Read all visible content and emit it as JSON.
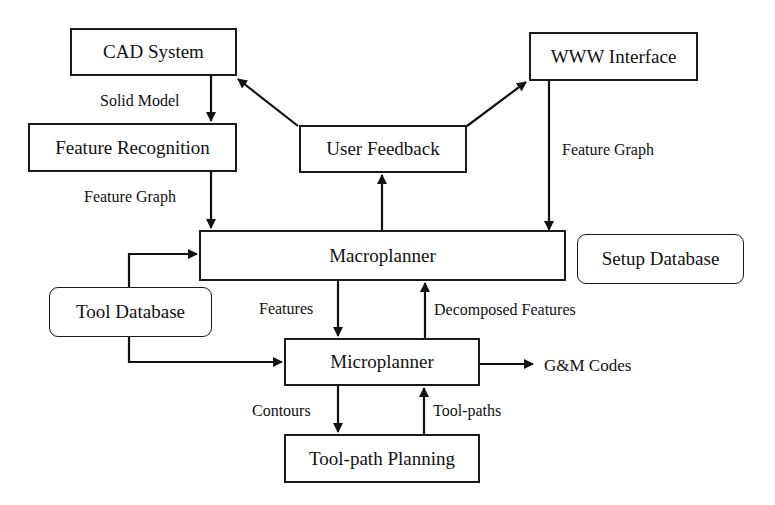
{
  "diagram": {
    "type": "flowchart",
    "nodes": {
      "cad_system": "CAD System",
      "www_interface": "WWW Interface",
      "feature_recognition": "Feature Recognition",
      "user_feedback": "User Feedback",
      "macroplanner": "Macroplanner",
      "setup_database": "Setup Database",
      "tool_database": "Tool Database",
      "microplanner": "Microplanner",
      "toolpath_planning": "Tool-path Planning"
    },
    "edge_labels": {
      "solid_model": "Solid Model",
      "feature_graph_left": "Feature Graph",
      "feature_graph_right": "Feature Graph",
      "features": "Features",
      "decomposed_features": "Decomposed Features",
      "gm_codes": "G&M Codes",
      "contours": "Contours",
      "toolpaths": "Tool-paths"
    },
    "edges": [
      {
        "from": "CAD System",
        "to": "Feature Recognition",
        "label": "Solid Model"
      },
      {
        "from": "Feature Recognition",
        "to": "Macroplanner",
        "label": "Feature Graph"
      },
      {
        "from": "WWW Interface",
        "to": "Macroplanner",
        "label": "Feature Graph"
      },
      {
        "from": "Macroplanner",
        "to": "User Feedback",
        "label": ""
      },
      {
        "from": "User Feedback",
        "to": "CAD System",
        "label": ""
      },
      {
        "from": "User Feedback",
        "to": "WWW Interface",
        "label": ""
      },
      {
        "from": "Tool Database",
        "to": "Macroplanner",
        "label": ""
      },
      {
        "from": "Tool Database",
        "to": "Microplanner",
        "label": ""
      },
      {
        "from": "Macroplanner",
        "to": "Microplanner",
        "label": "Features"
      },
      {
        "from": "Microplanner",
        "to": "Macroplanner",
        "label": "Decomposed Features"
      },
      {
        "from": "Microplanner",
        "to": "output",
        "label": "G&M Codes"
      },
      {
        "from": "Microplanner",
        "to": "Tool-path Planning",
        "label": "Contours"
      },
      {
        "from": "Tool-path Planning",
        "to": "Microplanner",
        "label": "Tool-paths"
      }
    ]
  }
}
